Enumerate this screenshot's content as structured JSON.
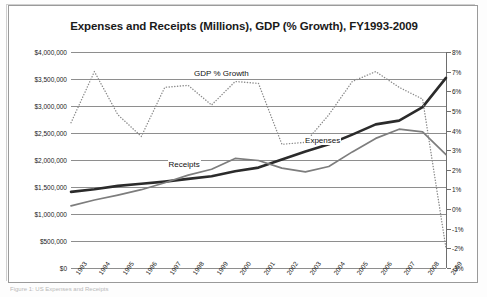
{
  "figure": {
    "caption_fragment": "Figure 1: US Expenses and Receipts"
  },
  "chart_data": {
    "type": "line",
    "title": "Expenses and Receipts (Millions), GDP  (% Growth), FY1993-2009",
    "xlabel": "",
    "ylabel": "",
    "y2label": "",
    "grid": true,
    "legend": "inline-annotations",
    "categories": [
      "1993",
      "1994",
      "1995",
      "1996",
      "1997",
      "1998",
      "1999",
      "2000",
      "2001",
      "2002",
      "2003",
      "2004",
      "2005",
      "2006",
      "2007",
      "2008",
      "2009"
    ],
    "ylim": [
      0,
      4000000
    ],
    "yticks": [
      "$0",
      "$500,000",
      "$1,000,000",
      "$1,500,000",
      "$2,000,000",
      "$2,500,000",
      "$3,000,000",
      "$3,500,000",
      "$4,000,000"
    ],
    "ytick_values": [
      0,
      500000,
      1000000,
      1500000,
      2000000,
      2500000,
      3000000,
      3500000,
      4000000
    ],
    "y2lim": [
      -3,
      8
    ],
    "y2ticks": [
      "-3%",
      "-2%",
      "-1%",
      "0%",
      "1%",
      "2%",
      "3%",
      "4%",
      "5%",
      "6%",
      "7%",
      "8%"
    ],
    "y2tick_values": [
      -3,
      -2,
      -1,
      0,
      1,
      2,
      3,
      4,
      5,
      6,
      7,
      8
    ],
    "series": [
      {
        "name": "Expenses",
        "axis": "left",
        "style": "solid-thick",
        "color": "#2b2b2b",
        "label_text": "Expenses",
        "values": [
          1410000,
          1460000,
          1520000,
          1560000,
          1600000,
          1650000,
          1700000,
          1790000,
          1860000,
          2010000,
          2160000,
          2290000,
          2470000,
          2660000,
          2730000,
          2980000,
          3520000
        ]
      },
      {
        "name": "Receipts",
        "axis": "left",
        "style": "solid-medium",
        "color": "#7d7d7d",
        "label_text": "Receipts",
        "values": [
          1150000,
          1260000,
          1350000,
          1450000,
          1580000,
          1720000,
          1830000,
          2030000,
          1990000,
          1850000,
          1780000,
          1880000,
          2150000,
          2400000,
          2570000,
          2520000,
          2100000
        ]
      },
      {
        "name": "GDP % Growth",
        "axis": "right",
        "style": "dotted",
        "color": "#8a8a8a",
        "label_text": "GDP % Growth",
        "values": [
          4.4,
          7.0,
          4.8,
          3.7,
          6.2,
          6.3,
          5.3,
          6.5,
          6.4,
          3.3,
          3.4,
          4.8,
          6.5,
          7.0,
          6.2,
          5.6,
          -2.0
        ]
      }
    ]
  }
}
